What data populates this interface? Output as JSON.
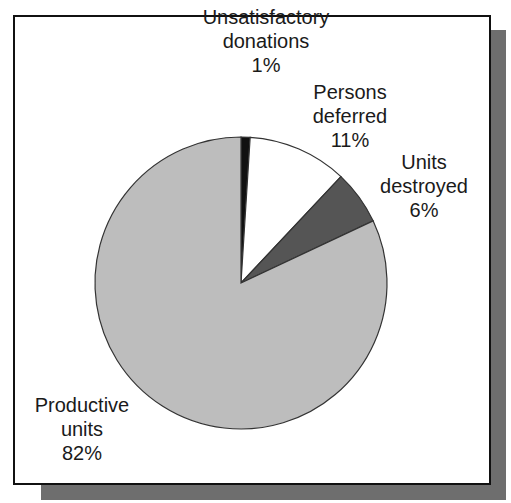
{
  "chart_data": {
    "type": "pie",
    "title": "",
    "start_angle_deg": 0,
    "direction": "clockwise",
    "slices": [
      {
        "label": "Unsatisfactory donations",
        "value": 1,
        "display": "1%",
        "color": "#111111"
      },
      {
        "label": "Persons deferred",
        "value": 11,
        "display": "11%",
        "color": "#ffffff"
      },
      {
        "label": "Units destroyed",
        "value": 6,
        "display": "6%",
        "color": "#555555"
      },
      {
        "label": "Productive units",
        "value": 82,
        "display": "82%",
        "color": "#bdbdbd"
      }
    ],
    "legend": "none",
    "labels_position": "outside"
  },
  "labels": {
    "unsatisfactory": {
      "line1": "Unsatisfactory",
      "line2": "donations",
      "pct": "1%"
    },
    "deferred": {
      "line1": "Persons",
      "line2": "deferred",
      "pct": "11%"
    },
    "destroyed": {
      "line1": "Units",
      "line2": "destroyed",
      "pct": "6%"
    },
    "productive": {
      "line1": "Productive",
      "line2": "units",
      "pct": "82%"
    }
  },
  "colors": {
    "frame_border": "#111111",
    "shadow": "#6e6e6e",
    "outline": "#333333"
  }
}
